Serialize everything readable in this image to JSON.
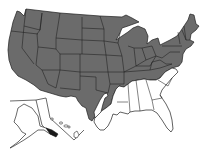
{
  "map": {
    "type": "species-distribution-range-map",
    "region": "United States",
    "legend": null,
    "colors": {
      "range_fill": "#6b6b6b",
      "outside_range_fill": "#ffffff",
      "border": "#1e1e1e",
      "alaska_range_fill": "#1a1a1a"
    },
    "range_description": "Shaded across nearly all of the contiguous US except the Gulf Coast and Southeast",
    "excluded_areas": [
      "Florida",
      "Georgia (most)",
      "South Carolina (most)",
      "Alabama (most)",
      "Mississippi (south)",
      "Louisiana (south)",
      "South Texas",
      "eastern North Carolina"
    ],
    "insets": [
      {
        "name": "Alaska",
        "range": "southeast panhandle shaded"
      },
      {
        "name": "Hawaii",
        "range": "none"
      }
    ]
  }
}
